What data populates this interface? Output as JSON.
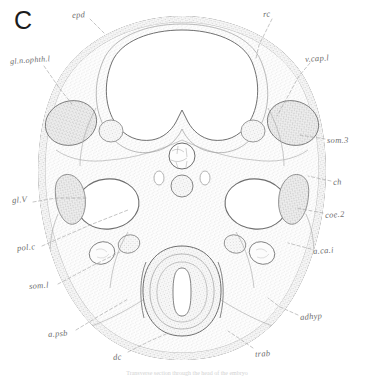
{
  "figure": {
    "letter": "C",
    "caption_fragment": "Transverse section through the head of the embryo"
  },
  "labels": [
    {
      "id": "epd",
      "text": "epd",
      "x": 72,
      "y": 11,
      "rotate": -4
    },
    {
      "id": "rc",
      "text": "rc",
      "x": 263,
      "y": 10,
      "rotate": -4
    },
    {
      "id": "v-cap-l",
      "text": "v.cap.l",
      "x": 305,
      "y": 55,
      "rotate": -4
    },
    {
      "id": "gl-n-ophth-l",
      "text": "gl.n.ophth.l",
      "x": 10,
      "y": 58,
      "rotate": -4
    },
    {
      "id": "som-3",
      "text": "som.3",
      "x": 327,
      "y": 136,
      "rotate": 0
    },
    {
      "id": "ch",
      "text": "ch",
      "x": 333,
      "y": 178,
      "rotate": -4
    },
    {
      "id": "gl-v",
      "text": "gl.V",
      "x": 12,
      "y": 196,
      "rotate": -4
    },
    {
      "id": "coe-2",
      "text": "coe.2",
      "x": 325,
      "y": 211,
      "rotate": -4
    },
    {
      "id": "pol-c",
      "text": "pol.c",
      "x": 17,
      "y": 244,
      "rotate": -6
    },
    {
      "id": "a-ca-i",
      "text": "a.ca.i",
      "x": 313,
      "y": 247,
      "rotate": -4
    },
    {
      "id": "som-l",
      "text": "som.l",
      "x": 29,
      "y": 282,
      "rotate": -4
    },
    {
      "id": "adhyp",
      "text": "adhyp",
      "x": 300,
      "y": 313,
      "rotate": -4
    },
    {
      "id": "a-psb",
      "text": "a.psb",
      "x": 48,
      "y": 330,
      "rotate": -4
    },
    {
      "id": "dc",
      "text": "dc",
      "x": 113,
      "y": 353,
      "rotate": -4
    },
    {
      "id": "trab",
      "text": "trab",
      "x": 255,
      "y": 350,
      "rotate": -4
    }
  ],
  "colors": {
    "ink": "#8a8a8a",
    "ink_dark": "#6a6a6a",
    "stipple": "#9a9a9a",
    "tissue_fill": "#fbfbfb",
    "ganglion_fill": "#e6e6e6",
    "lumen": "#ffffff",
    "leader": "#9e9e9e",
    "label_text": "#6d6d6d",
    "figure_letter": "#1c1c1c"
  },
  "leaders": [
    {
      "id": "leader-epd",
      "d": "M90,19 L104,33"
    },
    {
      "id": "leader-rc",
      "d": "M272,19 L259,45 L256,58"
    },
    {
      "id": "leader-v-cap-l",
      "d": "M310,63 L299,76 L288,96 L277,116"
    },
    {
      "id": "leader-gl-n-ophth-l",
      "d": "M44,66 L60,89 L72,104"
    },
    {
      "id": "leader-som-3",
      "d": "M325,139 L300,135"
    },
    {
      "id": "leader-ch",
      "d": "M331,181 L308,176"
    },
    {
      "id": "leader-gl-v",
      "d": "M33,202 L56,198 L86,198"
    },
    {
      "id": "leader-coe-2",
      "d": "M323,213 L296,208"
    },
    {
      "id": "leader-pol-c",
      "d": "M42,246 L90,225 L128,210"
    },
    {
      "id": "leader-a-ca-i",
      "d": "M311,249 L288,243"
    },
    {
      "id": "leader-som-l",
      "d": "M58,284 L92,266 L120,252"
    },
    {
      "id": "leader-adhyp",
      "d": "M298,315 L280,307 L268,298"
    },
    {
      "id": "leader-a-psb",
      "d": "M76,330 L104,313 L128,299"
    },
    {
      "id": "leader-dc",
      "d": "M128,352 L150,341 L166,334"
    },
    {
      "id": "leader-trab",
      "d": "M253,348 L240,339 L228,331"
    }
  ]
}
